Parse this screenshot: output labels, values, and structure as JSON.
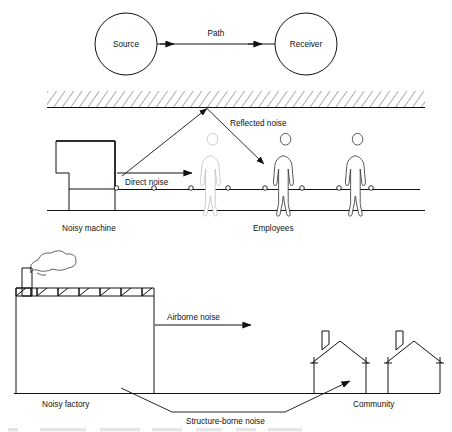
{
  "figure": {
    "panels": [
      {
        "id": "panel-source-path-receiver",
        "nodes": [
          {
            "id": "source",
            "label": "Source"
          },
          {
            "id": "receiver",
            "label": "Receiver"
          }
        ],
        "connector_label": "Path"
      },
      {
        "id": "panel-workplace",
        "labels": {
          "reflected_noise": "Reflected noise",
          "direct_noise": "Direct noise",
          "noisy_machine": "Noisy machine",
          "employees": "Employees"
        }
      },
      {
        "id": "panel-community",
        "labels": {
          "airborne_noise": "Airborne noise",
          "structure_borne_noise": "Structure-borne noise",
          "noisy_factory": "Noisy factory",
          "community": "Community"
        }
      }
    ]
  },
  "colors": {
    "ink": "#111111",
    "background": "#ffffff",
    "hatch": "#4a4a4a",
    "faint_figure": "#c4c4c4"
  }
}
